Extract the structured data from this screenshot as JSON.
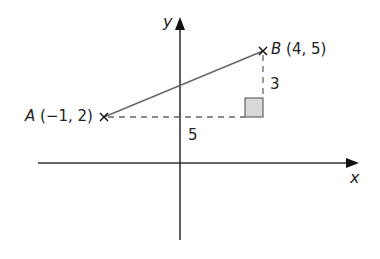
{
  "diagram": {
    "axes": {
      "x_label": "x",
      "y_label": "y"
    },
    "point_a": {
      "name": "A",
      "coords": "(−1, 2)"
    },
    "point_b": {
      "name": "B",
      "coords": "(4, 5)"
    },
    "horizontal_leg": "5",
    "vertical_leg": "3",
    "colors": {
      "line": "#555555",
      "axis": "#333333",
      "square_fill": "#d9d9d9"
    }
  }
}
